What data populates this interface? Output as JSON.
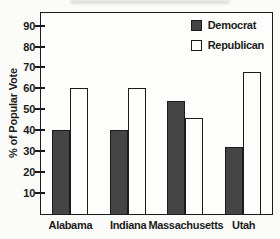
{
  "chart_data": {
    "type": "bar",
    "title": "",
    "xlabel": "",
    "ylabel": "% of Popular Vote",
    "categories": [
      "Alabama",
      "Indiana",
      "Massachusetts",
      "Utah"
    ],
    "series": [
      {
        "name": "Democrat",
        "values": [
          40,
          40,
          54,
          32
        ],
        "fill": "#454545"
      },
      {
        "name": "Republican",
        "values": [
          60,
          60,
          46,
          68
        ],
        "fill": "#fdfdfc"
      }
    ],
    "yticks": [
      10,
      20,
      30,
      40,
      50,
      60,
      70,
      80,
      90
    ],
    "ylim": [
      0,
      96
    ],
    "grid": false,
    "legend_position": "top-right-inside",
    "colors": {
      "ink": "#1b1b1b",
      "paper": "#fbfbfa",
      "democrat_fill": "#454545",
      "republican_fill": "#fdfdfc"
    }
  }
}
